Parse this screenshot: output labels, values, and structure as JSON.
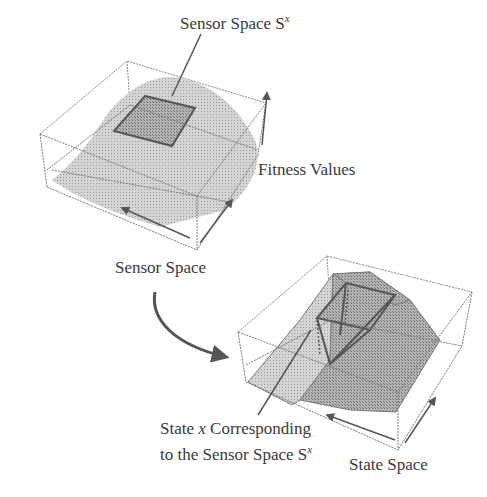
{
  "diagram": {
    "top_plot": {
      "callout_label": "Sensor Space S",
      "callout_superscript": "x",
      "z_axis_label": "Fitness Values",
      "base_axis_label": "Sensor Space"
    },
    "bottom_plot": {
      "callout_line1_prefix": "State ",
      "callout_line1_var": "x",
      "callout_line1_suffix": " Corresponding",
      "callout_line2": "to the Sensor Space S",
      "callout_line2_superscript": "x",
      "base_axis_label": "State Space"
    },
    "colors": {
      "box_edge": "#7a7a7a",
      "surface_fill": "#c8c8c8",
      "highlight_fill": "#a8a8a8",
      "highlight_edge": "#555555",
      "arrow": "#555555",
      "text": "#3a3a3a"
    }
  }
}
